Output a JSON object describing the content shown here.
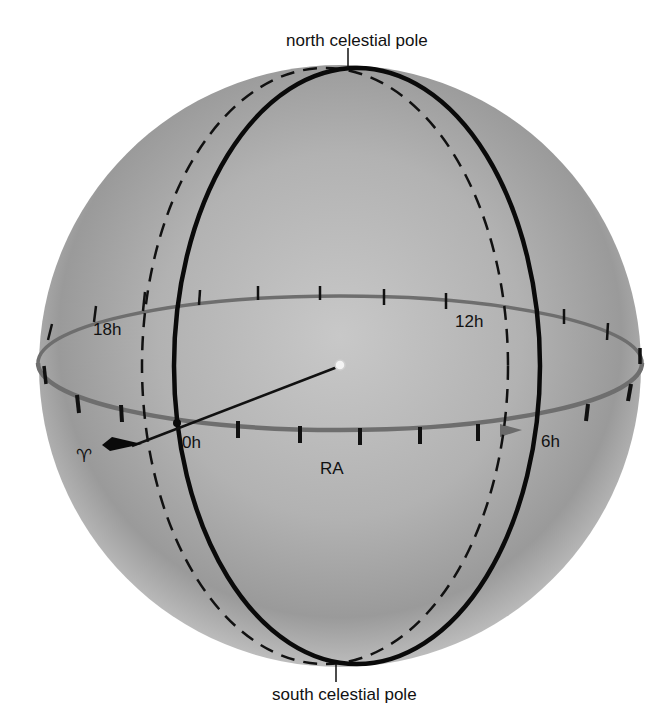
{
  "diagram": {
    "labels": {
      "north_pole": "north celestial pole",
      "south_pole": "south celestial pole",
      "ra_axis": "RA",
      "vernal_equinox_symbol": "♈︎",
      "hours": {
        "h0": "0h",
        "h6": "6h",
        "h12": "12h",
        "h18": "18h"
      }
    },
    "colors": {
      "sphere_light": "#d4d4d4",
      "sphere_mid": "#a9a9a9",
      "sphere_edge": "#8a8a8a",
      "equator": "#6e6e6e",
      "meridian": "#0a0a0a",
      "background": "#ffffff"
    },
    "geometry": {
      "sphere_center": [
        340,
        365
      ],
      "sphere_radius": 301,
      "equator_ellipse": {
        "cx": 340,
        "cy": 363,
        "rx": 302,
        "ry": 67
      },
      "hour_circle_solid": {
        "cx": 357,
        "cy": 366,
        "rx": 184,
        "ry": 298
      },
      "hour_circle_dashed": {
        "cx": 325,
        "cy": 366,
        "rx": 184,
        "ry": 298
      },
      "tick_count": 24
    },
    "elements": [
      "celestial sphere",
      "celestial equator with 24 hour ticks",
      "hour circle through 0h and 12h (solid)",
      "hour circle of a star (dashed)",
      "line from center to vernal equinox",
      "RA direction arrow"
    ]
  }
}
